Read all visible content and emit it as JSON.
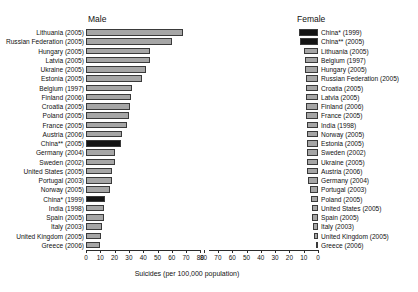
{
  "chart_data": {
    "type": "bar",
    "title": "",
    "xlabel": "Suicides (per 100,000 population)",
    "ylabel": "",
    "orientation": "horizontal",
    "layout": "back-to-back paired panels, each panel independently sorted descending",
    "grid": false,
    "legend": null,
    "xlim": [
      0,
      80
    ],
    "xticks": [
      0,
      10,
      20,
      30,
      40,
      50,
      60,
      70,
      80
    ],
    "colors": {
      "bar_grey": "#a6a6a6",
      "bar_black": "#151515",
      "bar_outline": "#3a3a3a",
      "axis": "#2b2b2b",
      "text": "#111111",
      "background": "#ffffff"
    },
    "panels": [
      {
        "name": "Male",
        "axis_direction": "left-to-right, 0 at left",
        "categories": [
          "Lithuania (2005)",
          "Russian Federation (2005)",
          "Hungary (2005)",
          "Latvia (2005)",
          "Ukraine (2005)",
          "Estonia (2005)",
          "Belgium (1997)",
          "Finland (2006)",
          "Croatia (2005)",
          "Poland (2005)",
          "France (2005)",
          "Austria (2006)",
          "China** (2005)",
          "Germany (2004)",
          "Sweden (2002)",
          "United States (2005)",
          "Portugal (2003)",
          "Norway (2005)",
          "China* (1999)",
          "India (1998)",
          "Spain (2005)",
          "Italy (2003)",
          "United Kingdom (2005)",
          "Greece (2006)"
        ],
        "values": [
          68,
          60,
          45,
          44.5,
          42,
          39,
          32,
          31.5,
          31,
          30,
          28.5,
          25.5,
          24.5,
          20.5,
          20,
          18.5,
          18.5,
          17,
          13.5,
          12.5,
          12.5,
          11.5,
          10.5,
          10
        ],
        "highlighted": [
          "China** (2005)",
          "China* (1999)"
        ]
      },
      {
        "name": "Female",
        "axis_direction": "right-to-left, 0 at right",
        "categories": [
          "China* (1999)",
          "China** (2005)",
          "Lithuania (2005)",
          "Belgium (1997)",
          "Hungary (2005)",
          "Russian Federation (2005)",
          "Croatia (2005)",
          "Latvia (2005)",
          "Finland (2006)",
          "France (2005)",
          "India (1998)",
          "Norway (2005)",
          "Estonia (2005)",
          "Sweden (2002)",
          "Ukraine (2005)",
          "Austria (2006)",
          "Germany (2004)",
          "Portugal (2003)",
          "Poland (2005)",
          "United States (2005)",
          "Spain (2005)",
          "Italy (2003)",
          "United Kingdom (2005)",
          "Greece (2006)"
        ],
        "values": [
          13.5,
          12.5,
          9.5,
          9,
          9,
          8.5,
          8.5,
          8.5,
          8.5,
          8.5,
          8,
          7.5,
          7.5,
          7.5,
          7.5,
          7.5,
          7,
          5.5,
          5,
          4.5,
          4,
          3.5,
          3,
          1.5
        ],
        "highlighted": [
          "China* (1999)",
          "China** (2005)"
        ]
      }
    ]
  },
  "axis": {
    "male_ticks": [
      "0",
      "10",
      "20",
      "30",
      "40",
      "50",
      "60",
      "70",
      "80"
    ],
    "female_ticks": [
      "80",
      "70",
      "60",
      "50",
      "40",
      "30",
      "20",
      "10",
      "0"
    ],
    "caption": "Suicides (per 100,000 population)"
  },
  "panel_titles": {
    "male": "Male",
    "female": "Female"
  }
}
